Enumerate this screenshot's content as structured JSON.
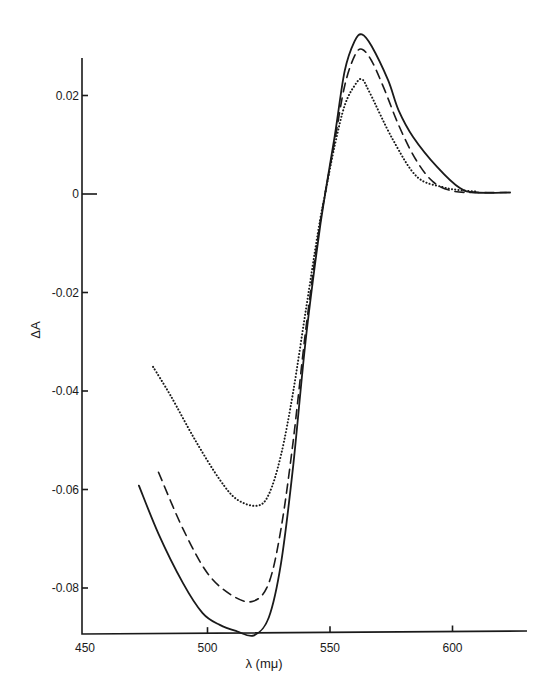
{
  "chart_data": {
    "type": "line",
    "title": "",
    "xlabel": "λ (mμ)",
    "ylabel": "ΔA",
    "xlim": [
      450,
      630
    ],
    "ylim": [
      -0.09,
      0.028
    ],
    "grid": false,
    "legend": null,
    "x_ticks": [
      450,
      500,
      550,
      600
    ],
    "x_tick_labels": [
      "450",
      "500",
      "550",
      "600"
    ],
    "y_ticks": [
      0.02,
      0,
      -0.02,
      -0.04,
      -0.06,
      -0.08
    ],
    "y_tick_labels": [
      "0.02",
      "0",
      "-0.02",
      "-0.04",
      "-0.06",
      "-0.08"
    ],
    "series": [
      {
        "name": "solid",
        "style": "solid",
        "x": [
          472,
          480,
          490,
          498,
          505,
          512,
          519,
          525,
          530,
          535,
          540,
          545,
          548,
          552,
          556,
          560,
          563,
          567,
          573.7,
          578,
          583.9,
          593.7,
          603,
          610,
          623.5
        ],
        "y": [
          -0.0592,
          -0.069,
          -0.079,
          -0.0851,
          -0.0875,
          -0.0888,
          -0.0896,
          -0.086,
          -0.075,
          -0.055,
          -0.03,
          -0.01,
          0.0,
          0.012,
          0.025,
          0.031,
          0.0324,
          0.03,
          0.0231,
          0.017,
          0.0116,
          0.0055,
          0.0012,
          0.0003,
          0.0003
        ]
      },
      {
        "name": "dashed",
        "style": "dashed",
        "x": [
          480,
          490,
          500,
          510,
          518.6,
          525,
          530,
          535,
          540,
          545,
          548,
          552,
          556,
          560,
          563,
          567,
          572,
          578,
          585,
          592,
          600,
          610,
          622
        ],
        "y": [
          -0.0565,
          -0.068,
          -0.077,
          -0.0815,
          -0.0827,
          -0.079,
          -0.068,
          -0.05,
          -0.028,
          -0.009,
          0.0,
          0.011,
          0.022,
          0.028,
          0.0294,
          0.027,
          0.0215,
          0.014,
          0.007,
          0.0025,
          0.0006,
          0.0003,
          0.0003
        ]
      },
      {
        "name": "dotted",
        "style": "dotted",
        "x": [
          477.8,
          485,
          495,
          505,
          512,
          520.2,
          525,
          530,
          535,
          540,
          545,
          548,
          552,
          556,
          560,
          563,
          566.3,
          575.7,
          585.5,
          596,
          603,
          610
        ],
        "y": [
          -0.0351,
          -0.041,
          -0.05,
          -0.058,
          -0.062,
          -0.0633,
          -0.061,
          -0.053,
          -0.04,
          -0.024,
          -0.008,
          0.0,
          0.01,
          0.018,
          0.022,
          0.0233,
          0.0205,
          0.011,
          0.0035,
          0.0014,
          0.0008,
          0.0005
        ]
      }
    ]
  },
  "layout": {
    "plot": {
      "x0_px": 85,
      "x_per_unit": 2.45,
      "x_origin": 450,
      "y0_px": 194,
      "y_per_unit": 4925
    },
    "axis": {
      "y_axis_x": 82,
      "y_top": 58,
      "x_axis_y": 634,
      "x_right": 527
    }
  }
}
